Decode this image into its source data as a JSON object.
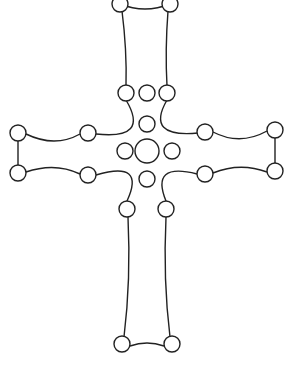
{
  "diagram": {
    "stroke_color": "#222222",
    "background_color": "#ffffff",
    "parts": [
      "top-arm",
      "left-arm",
      "right-arm",
      "bottom-arm",
      "center-cluster"
    ],
    "node_groups": {
      "top_arm_end": 2,
      "upper_junction": 3,
      "left_arm": 4,
      "right_arm": 4,
      "center_cluster": 5,
      "lower_junction": 2,
      "bottom_arm_end": 2
    }
  }
}
